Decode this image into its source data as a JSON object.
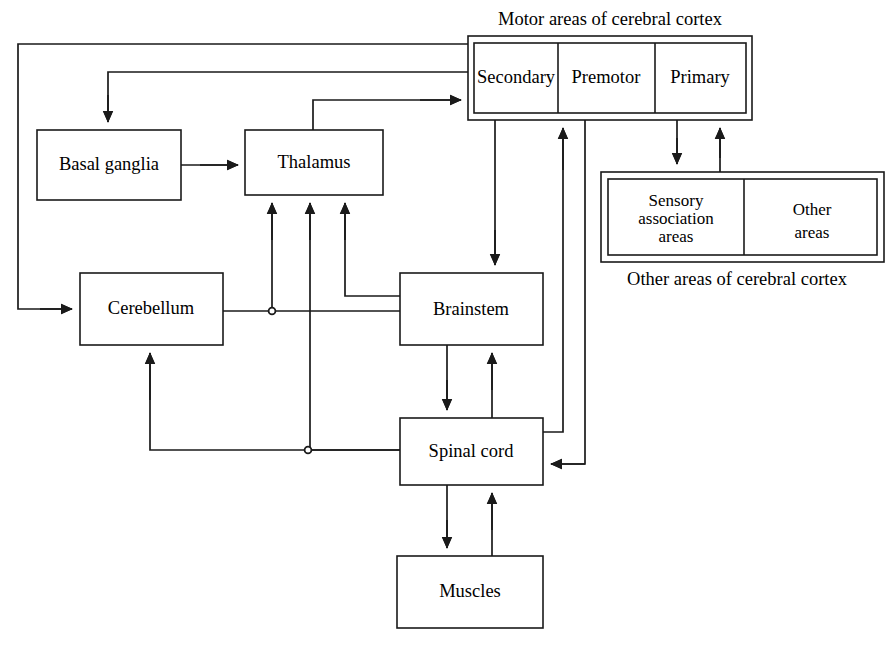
{
  "diagram": {
    "title_top": "Motor areas of cerebral cortex",
    "caption_bottom": "Other areas of cerebral cortex",
    "nodes": {
      "basal_ganglia": "Basal ganglia",
      "thalamus": "Thalamus",
      "cerebellum": "Cerebellum",
      "brainstem": "Brainstem",
      "spinal_cord": "Spinal cord",
      "muscles": "Muscles"
    },
    "motor_cortex_cells": {
      "secondary": "Secondary",
      "premotor": "Premotor",
      "primary": "Primary"
    },
    "other_cortex_cells": {
      "sensory_line1": "Sensory",
      "sensory_line2": "association",
      "sensory_line3": "areas",
      "other_line1": "Other",
      "other_line2": "areas"
    },
    "colors": {
      "line": "#1a1a1a",
      "fill": "#ffffff",
      "text": "#000000"
    }
  }
}
